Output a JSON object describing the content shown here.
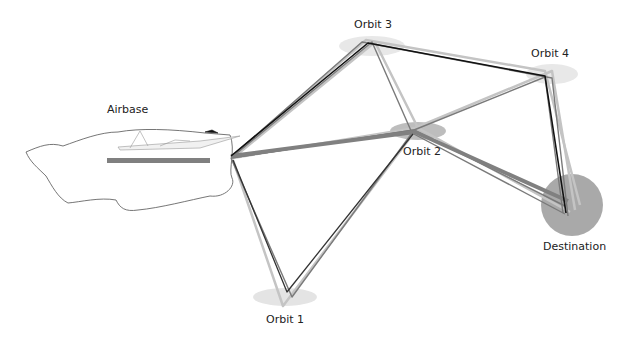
{
  "labels": {
    "airbase": "Airbase",
    "orbit1": "Orbit 1",
    "orbit2": "Orbit 2",
    "orbit3": "Orbit 3",
    "orbit4": "Orbit 4",
    "destination": "Destination"
  },
  "nodes": {
    "airbase": {
      "x": 231,
      "y": 156
    },
    "orbit1": {
      "x": 287,
      "y": 297
    },
    "orbit2": {
      "x": 415,
      "y": 132
    },
    "orbit3": {
      "x": 368,
      "y": 45
    },
    "orbit4": {
      "x": 548,
      "y": 75
    },
    "destination": {
      "x": 572,
      "y": 207
    }
  },
  "colors": {
    "zone_light": "#e0e0e0",
    "zone_mid": "#b5b5b5",
    "destination_zone": "#a9a9a9",
    "runway": "#808080",
    "path_dark": "#111111",
    "path_mid": "#777777",
    "path_light": "#bdbdbd"
  }
}
